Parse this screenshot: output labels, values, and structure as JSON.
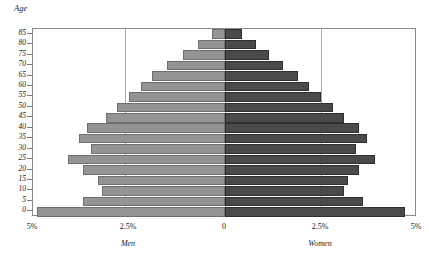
{
  "chart_data": {
    "type": "bar",
    "subtype": "population-pyramid",
    "title": "",
    "ylabel": "Age",
    "xlabel": "",
    "grid": true,
    "legend_position": "below-axis",
    "xlim": [
      -5,
      5
    ],
    "xtick_labels": [
      "5%",
      "2.5%",
      "0",
      "2.5%",
      "5%"
    ],
    "xtick_values": [
      -5,
      -2.5,
      0,
      2.5,
      5
    ],
    "categories": [
      "0",
      "5",
      "10",
      "15",
      "20",
      "25",
      "30",
      "35",
      "40",
      "45",
      "50",
      "55",
      "60",
      "65",
      "70",
      "75",
      "80",
      "85"
    ],
    "series": [
      {
        "name": "Men",
        "color": "#949494",
        "side": "left",
        "values": [
          4.9,
          3.7,
          3.2,
          3.3,
          3.7,
          4.1,
          3.5,
          3.8,
          3.6,
          3.1,
          2.8,
          2.5,
          2.2,
          1.9,
          1.5,
          1.1,
          0.7,
          0.35
        ]
      },
      {
        "name": "Women",
        "color": "#4a4a4a",
        "side": "right",
        "values": [
          4.7,
          3.6,
          3.1,
          3.2,
          3.5,
          3.9,
          3.4,
          3.7,
          3.5,
          3.1,
          2.8,
          2.5,
          2.2,
          1.9,
          1.5,
          1.15,
          0.8,
          0.45
        ]
      }
    ]
  },
  "axis": {
    "y_title": "Age",
    "y_tick_labels": [
      "85",
      "80",
      "75",
      "70",
      "65",
      "60",
      "55",
      "50",
      "45",
      "40",
      "35",
      "30",
      "25",
      "20",
      "15",
      "10",
      "5",
      "0"
    ],
    "x_tick_labels": [
      "5%",
      "2.5%",
      "0",
      "2.5%",
      "5%"
    ]
  },
  "group_labels": {
    "men": "Men",
    "women": "Women"
  },
  "colors": {
    "men_bar": "#949494",
    "women_bar": "#4a4a4a",
    "gridline": "#a8a8a8",
    "frame": "#8a8a8a",
    "background": "#ffffff"
  }
}
